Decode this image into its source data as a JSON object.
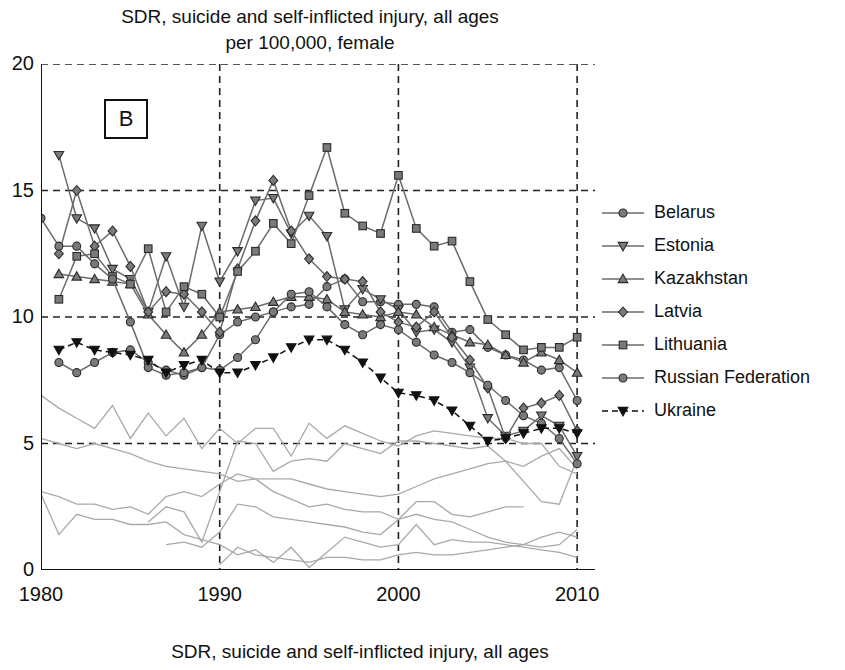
{
  "title": {
    "line1": "SDR, suicide and self-inflicted injury, all ages",
    "line2": "per 100,000, female"
  },
  "caption": "SDR, suicide and self-inflicted injury, all ages",
  "panel_label": "B",
  "axis": {
    "y_ticks": [
      "0",
      "5",
      "10",
      "15",
      "20"
    ],
    "x_ticks": [
      "1980",
      "1990",
      "2000",
      "2010"
    ]
  },
  "legend": {
    "items": [
      {
        "label": "Belarus",
        "marker": "circle",
        "dash": false
      },
      {
        "label": "Estonia",
        "marker": "triangle-down",
        "dash": false
      },
      {
        "label": "Kazakhstan",
        "marker": "triangle-up",
        "dash": false
      },
      {
        "label": "Latvia",
        "marker": "diamond",
        "dash": false
      },
      {
        "label": "Lithuania",
        "marker": "square",
        "dash": false
      },
      {
        "label": "Russian Federation",
        "marker": "circle",
        "dash": false
      },
      {
        "label": "Ukraine",
        "marker": "triangle-down-filled",
        "dash": true
      }
    ]
  },
  "colors": {
    "marker_fill": "#7a7a7a",
    "marker_stroke": "#2b2b2b",
    "line": "#6b6b6b",
    "ukraine": "#111111",
    "background_line": "#a9a9a9",
    "axis": "#111111",
    "grid": "#222222"
  },
  "chart_data": {
    "type": "line",
    "title": "SDR, suicide and self-inflicted injury, all ages per 100,000, female",
    "xlabel": "",
    "ylabel": "",
    "xlim": [
      1980,
      2011
    ],
    "ylim": [
      0,
      20
    ],
    "grid": true,
    "legend_position": "right",
    "x": [
      1980,
      1981,
      1982,
      1983,
      1984,
      1985,
      1986,
      1987,
      1988,
      1989,
      1990,
      1991,
      1992,
      1993,
      1994,
      1995,
      1996,
      1997,
      1998,
      1999,
      2000,
      2001,
      2002,
      2003,
      2004,
      2005,
      2006,
      2007,
      2008,
      2009,
      2010
    ],
    "series": [
      {
        "name": "Belarus",
        "marker": "circle",
        "values": [
          null,
          8.2,
          7.8,
          8.2,
          8.6,
          8.7,
          8.2,
          7.9,
          7.7,
          8.0,
          9.3,
          9.8,
          10.0,
          10.2,
          10.4,
          10.5,
          11.2,
          11.5,
          10.6,
          10.6,
          10.5,
          10.5,
          10.4,
          9.4,
          9.5,
          8.8,
          8.5,
          8.3,
          7.9,
          8.0,
          6.7
        ]
      },
      {
        "name": "Estonia",
        "marker": "triangle-down",
        "values": [
          null,
          16.4,
          13.9,
          13.5,
          11.9,
          11.5,
          10.2,
          12.4,
          10.4,
          13.6,
          11.4,
          12.6,
          14.6,
          14.7,
          13.3,
          14.0,
          13.2,
          10.3,
          11.1,
          10.7,
          10.3,
          9.4,
          9.5,
          9.0,
          8.0,
          6.0,
          5.3,
          5.5,
          6.1,
          5.7,
          4.5
        ]
      },
      {
        "name": "Kazakhstan",
        "marker": "triangle-up",
        "values": [
          null,
          11.7,
          11.6,
          11.5,
          11.4,
          11.3,
          10.1,
          9.3,
          8.6,
          9.3,
          10.2,
          10.3,
          10.4,
          10.6,
          10.8,
          10.8,
          10.7,
          10.2,
          10.1,
          10.0,
          10.2,
          10.1,
          9.6,
          9.3,
          9.0,
          8.9,
          8.5,
          8.2,
          8.6,
          8.3,
          7.8
        ]
      },
      {
        "name": "Latvia",
        "marker": "diamond",
        "values": [
          null,
          12.5,
          15.0,
          12.8,
          13.4,
          12.0,
          10.2,
          11.0,
          10.9,
          10.2,
          9.4,
          11.9,
          13.8,
          15.4,
          13.4,
          12.3,
          11.6,
          11.5,
          11.4,
          10.2,
          9.8,
          9.6,
          10.2,
          9.2,
          8.3,
          7.2,
          5.2,
          6.4,
          6.6,
          6.9,
          5.5
        ]
      },
      {
        "name": "Lithuania",
        "marker": "square",
        "values": [
          null,
          10.7,
          12.4,
          12.5,
          11.6,
          11.3,
          12.7,
          10.2,
          11.2,
          10.9,
          10.0,
          11.8,
          12.6,
          13.7,
          12.9,
          14.8,
          16.7,
          14.1,
          13.6,
          13.3,
          15.6,
          13.5,
          12.8,
          13.0,
          11.4,
          9.9,
          9.3,
          8.7,
          8.8,
          8.8,
          9.2
        ]
      },
      {
        "name": "Russian Federation",
        "marker": "circle",
        "values": [
          13.9,
          12.8,
          12.8,
          12.1,
          11.5,
          9.8,
          8.0,
          7.7,
          7.8,
          8.0,
          7.9,
          8.4,
          9.1,
          10.2,
          10.9,
          11.0,
          10.4,
          9.7,
          9.3,
          9.7,
          9.5,
          9.0,
          8.5,
          8.2,
          7.8,
          7.3,
          6.7,
          6.1,
          5.8,
          5.2,
          4.2
        ]
      },
      {
        "name": "Ukraine",
        "marker": "triangle-down-filled",
        "dash": true,
        "values": [
          null,
          8.7,
          9.0,
          8.7,
          8.6,
          8.5,
          8.3,
          7.8,
          8.1,
          8.3,
          7.8,
          7.8,
          8.1,
          8.4,
          8.8,
          9.1,
          9.1,
          8.7,
          8.2,
          7.6,
          7.0,
          6.9,
          6.7,
          6.3,
          5.7,
          5.1,
          5.2,
          5.4,
          5.6,
          5.6,
          5.4
        ]
      }
    ],
    "background_series": [
      {
        "name": "bg-1",
        "values": [
          6.9,
          6.4,
          6.0,
          5.6,
          6.5,
          5.2,
          6.2,
          5.3,
          6.0,
          4.8,
          5.6,
          5.0,
          5.6,
          5.6,
          4.5,
          5.8,
          5.2,
          5.7,
          5.4,
          5.1,
          4.9,
          5.3,
          5.5,
          5.4,
          5.3,
          5.2,
          5.2,
          5.0,
          5.0,
          4.1,
          3.8
        ]
      },
      {
        "name": "bg-2",
        "values": [
          5.2,
          5.0,
          4.8,
          5.0,
          4.8,
          4.6,
          4.3,
          4.1,
          4.0,
          3.9,
          3.8,
          3.5,
          3.6,
          3.6,
          3.6,
          3.4,
          3.2,
          3.1,
          3.0,
          2.9,
          3.0,
          3.3,
          3.6,
          3.8,
          4.0,
          4.2,
          4.3,
          4.1,
          4.5,
          4.8,
          4.0
        ]
      },
      {
        "name": "bg-3",
        "values": [
          3.1,
          2.9,
          2.6,
          2.6,
          2.4,
          2.5,
          2.2,
          2.9,
          3.1,
          2.9,
          3.4,
          3.8,
          3.6,
          3.1,
          2.8,
          2.5,
          2.6,
          2.4,
          2.3,
          2.3,
          2.0,
          2.2,
          2.0,
          1.9,
          1.6,
          1.3,
          1.1,
          1.0,
          0.9,
          1.0,
          1.6
        ]
      },
      {
        "name": "bg-4",
        "values": [
          3.0,
          1.4,
          2.2,
          2.0,
          2.0,
          1.8,
          1.8,
          1.9,
          1.4,
          1.2,
          1.0,
          0.6,
          0.8,
          0.3,
          0.9,
          0.1,
          0.7,
          1.3,
          1.1,
          0.9,
          1.0,
          1.8,
          1.0,
          1.2,
          1.1,
          1.1,
          1.0,
          0.9,
          0.8,
          0.7,
          0.5
        ]
      },
      {
        "name": "bg-5",
        "values": [
          null,
          null,
          null,
          null,
          null,
          null,
          null,
          1.0,
          1.1,
          0.9,
          1.5,
          2.6,
          2.5,
          2.1,
          2.0,
          1.9,
          1.8,
          1.7,
          1.5,
          1.4,
          2.0,
          2.7,
          2.7,
          2.2,
          2.1,
          2.3,
          2.5,
          2.5,
          null,
          null,
          null
        ]
      },
      {
        "name": "bg-6",
        "values": [
          null,
          null,
          null,
          null,
          null,
          null,
          1.9,
          2.5,
          2.3,
          1.1,
          3.1,
          5.1,
          5.0,
          3.9,
          4.3,
          4.4,
          4.3,
          5.0,
          4.8,
          4.6,
          5.1,
          5.1,
          5.0,
          4.9,
          4.8,
          4.9,
          4.3,
          3.5,
          2.7,
          2.6,
          4.4
        ]
      },
      {
        "name": "bg-7",
        "values": [
          null,
          null,
          null,
          null,
          null,
          null,
          null,
          null,
          null,
          null,
          0.2,
          0.9,
          0.6,
          0.5,
          0.4,
          0.3,
          0.5,
          0.5,
          0.4,
          0.4,
          0.6,
          0.7,
          0.6,
          0.6,
          0.7,
          0.8,
          0.9,
          1.0,
          1.3,
          1.5,
          1.3
        ]
      }
    ]
  }
}
